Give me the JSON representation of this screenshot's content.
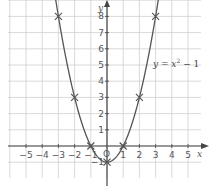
{
  "chart_data": {
    "type": "line",
    "title": "",
    "equation_label": "y = x² − 1",
    "equation_parts": {
      "lhs": "y",
      "eq": " = ",
      "var": "x",
      "exp": "2",
      "rest": " − 1"
    },
    "xlabel": "x",
    "ylabel": "y",
    "origin_label": "O",
    "xlim": [
      -6,
      6
    ],
    "ylim": [
      -2,
      9
    ],
    "grid": true,
    "x_ticks": [
      -5,
      -4,
      -3,
      -2,
      -1,
      1,
      2,
      3,
      4,
      5
    ],
    "x_tick_labels": [
      "−5",
      "−4",
      "−3",
      "−2",
      "−1",
      "1",
      "2",
      "3",
      "4",
      "5"
    ],
    "y_ticks": [
      -1,
      1,
      2,
      3,
      4,
      5,
      6,
      7,
      8
    ],
    "y_tick_labels": [
      "−1",
      "1",
      "2",
      "3",
      "4",
      "5",
      "6",
      "7",
      "8"
    ],
    "series": [
      {
        "name": "y = x² − 1",
        "plotted_points": [
          {
            "x": -3,
            "y": 8
          },
          {
            "x": -2,
            "y": 3
          },
          {
            "x": -1,
            "y": 0
          },
          {
            "x": 0,
            "y": -1
          },
          {
            "x": 1,
            "y": 0
          },
          {
            "x": 2,
            "y": 3
          },
          {
            "x": 3,
            "y": 8
          }
        ],
        "marker": "cross",
        "color": "#555555"
      }
    ]
  },
  "colors": {
    "grid": "#cfcfcf",
    "axis": "#444444",
    "curve": "#555555",
    "background": "#ffffff"
  }
}
